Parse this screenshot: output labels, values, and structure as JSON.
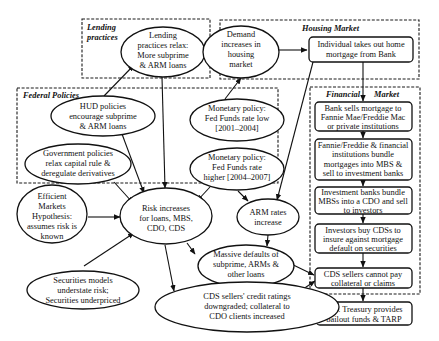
{
  "groups": {
    "lending": {
      "label_line1": "Lending",
      "label_line2": "practices"
    },
    "housing": {
      "label": "Housing Market"
    },
    "federal": {
      "label": "Federal Policies"
    },
    "financial": {
      "label_left": "Financial",
      "label_right": "Market"
    }
  },
  "nodes": {
    "lending_relax": {
      "lines": [
        "Lending",
        "practices relax:",
        "More subprime",
        "& ARM loans"
      ]
    },
    "demand": {
      "lines": [
        "Demand",
        "increases in",
        "housing",
        "market"
      ]
    },
    "individual": {
      "lines": [
        "Individual takes out home",
        "mortgage from Bank"
      ]
    },
    "hud": {
      "lines": [
        "HUD policies",
        "encourage subprime",
        "& ARM loans"
      ]
    },
    "gov": {
      "lines": [
        "Government policies",
        "relax capital rule &",
        "deregulate derivatives"
      ]
    },
    "monetary_low": {
      "lines": [
        "Monetary policy:",
        "Fed Funds rate low",
        "[2001–2004]"
      ]
    },
    "monetary_high": {
      "lines": [
        "Monetary policy:",
        "Fed Funds rate",
        "higher [2004–2007]"
      ]
    },
    "bank_sells": {
      "lines": [
        "Bank sells mortgage to",
        "Fannie Mae/Freddie Mac",
        "or private institutions"
      ]
    },
    "fannie": {
      "lines": [
        "Fannie/Freddie & financial",
        "institutions bundle",
        "mortgages into MBS &",
        "sell to investment banks"
      ]
    },
    "investment": {
      "lines": [
        "Investment banks bundle",
        "MBSs into a CDO and sell",
        "to investors"
      ]
    },
    "investors": {
      "lines": [
        "Investors buy CDSs to",
        "insure against mortgage",
        "default on securities"
      ]
    },
    "cds_cannot": {
      "lines": [
        "CDS sellers cannot pay",
        "collateral or claims"
      ]
    },
    "treasury": {
      "lines": [
        "U.S. Treasury provides",
        "bailout funds & TARP"
      ]
    },
    "efficient": {
      "lines": [
        "Efficient",
        "Markets",
        "Hypothesis:",
        "assumes risk is",
        "known"
      ]
    },
    "risk": {
      "lines": [
        "Risk increases",
        "for loans, MBS,",
        "CDO, CDS"
      ]
    },
    "arm": {
      "lines": [
        "ARM rates",
        "increase"
      ]
    },
    "securities": {
      "lines": [
        "Securities models",
        "understate risk;",
        "Securities underpriced"
      ]
    },
    "defaults": {
      "lines": [
        "Massive defaults of",
        "subprime, ARMs &",
        "other loans"
      ]
    },
    "cds_ratings": {
      "lines": [
        "CDS sellers' credit ratings",
        "downgraded; collateral to",
        "CDO clients increased"
      ]
    }
  },
  "edges": [
    {
      "from": "lending_relax",
      "to": "demand"
    },
    {
      "from": "demand",
      "to": "individual"
    },
    {
      "from": "individual",
      "to": "bank_sells"
    },
    {
      "from": "hud",
      "to": "lending_relax"
    },
    {
      "from": "monetary_low",
      "to": "demand"
    },
    {
      "from": "lending_relax",
      "to": "risk"
    },
    {
      "from": "hud",
      "to": "risk"
    },
    {
      "from": "gov",
      "to": "risk"
    },
    {
      "from": "monetary_high",
      "to": "risk"
    },
    {
      "from": "monetary_high",
      "to": "arm"
    },
    {
      "from": "individual",
      "to": "arm"
    },
    {
      "from": "efficient",
      "to": "risk"
    },
    {
      "from": "securities",
      "to": "risk"
    },
    {
      "from": "risk",
      "to": "defaults"
    },
    {
      "from": "risk",
      "to": "cds_ratings"
    },
    {
      "from": "arm",
      "to": "defaults"
    },
    {
      "from": "defaults",
      "to": "cds_ratings"
    },
    {
      "from": "defaults",
      "to": "cds_cannot"
    },
    {
      "from": "cds_ratings",
      "to": "cds_cannot"
    },
    {
      "from": "bank_sells",
      "to": "fannie"
    },
    {
      "from": "fannie",
      "to": "investment"
    },
    {
      "from": "investment",
      "to": "investors"
    },
    {
      "from": "investors",
      "to": "cds_cannot"
    },
    {
      "from": "cds_cannot",
      "to": "treasury"
    }
  ]
}
